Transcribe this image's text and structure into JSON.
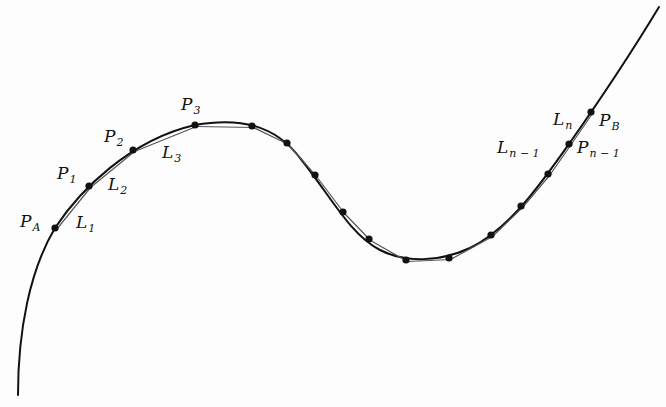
{
  "diagram": {
    "colors": {
      "curve": "#111111",
      "chord": "#555555",
      "point": "#111111",
      "background": "#fdfdfd"
    },
    "curve_path": "M 18 395 C 18 330, 30 270, 55 228 C 80 190, 130 140, 195 125 C 240 117, 275 125, 300 158 C 330 195, 350 235, 380 250 C 405 263, 440 262, 470 248 C 510 228, 540 185, 569 144 C 595 107, 630 55, 659 7",
    "points": [
      {
        "id": "P_A",
        "x": 55,
        "y": 228
      },
      {
        "id": "P1",
        "x": 89,
        "y": 186
      },
      {
        "id": "P2",
        "x": 133,
        "y": 150
      },
      {
        "id": "P3",
        "x": 195,
        "y": 125
      },
      {
        "id": "p4",
        "x": 252,
        "y": 126
      },
      {
        "id": "p5",
        "x": 287,
        "y": 143
      },
      {
        "id": "p6",
        "x": 315,
        "y": 175
      },
      {
        "id": "p7",
        "x": 343,
        "y": 212
      },
      {
        "id": "p8",
        "x": 369,
        "y": 239
      },
      {
        "id": "p9",
        "x": 406,
        "y": 260
      },
      {
        "id": "p10",
        "x": 449,
        "y": 258
      },
      {
        "id": "p11",
        "x": 491,
        "y": 235
      },
      {
        "id": "p12",
        "x": 521,
        "y": 206
      },
      {
        "id": "p13",
        "x": 548,
        "y": 174
      },
      {
        "id": "P_n-1",
        "x": 569,
        "y": 144
      },
      {
        "id": "P_B",
        "x": 591,
        "y": 112
      }
    ],
    "labels": {
      "pa": {
        "base": "P",
        "sub": "A"
      },
      "p1": {
        "base": "P",
        "sub": "1"
      },
      "p2": {
        "base": "P",
        "sub": "2"
      },
      "p3": {
        "base": "P",
        "sub": "3"
      },
      "l1": {
        "base": "L",
        "sub": "1"
      },
      "l2": {
        "base": "L",
        "sub": "2"
      },
      "l3": {
        "base": "L",
        "sub": "3"
      },
      "ln": {
        "base": "L",
        "sub": "n"
      },
      "ln1": {
        "base": "L",
        "sub": "n − 1"
      },
      "pb": {
        "base": "P",
        "sub": "B"
      },
      "pn1": {
        "base": "P",
        "sub": "n − 1"
      }
    }
  }
}
